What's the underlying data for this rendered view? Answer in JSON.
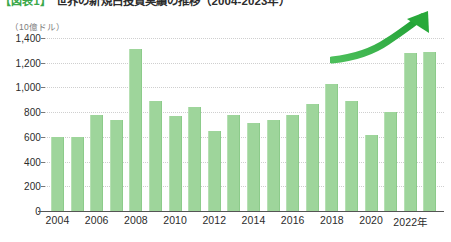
{
  "header": {
    "tag": "【図表1】",
    "title": "世界の新規白投資実績の推移（2004-2023年）"
  },
  "axis": {
    "unit_label": "（10億ドル）",
    "y_ticks": [
      "0",
      "200",
      "400",
      "600",
      "800",
      "1,000",
      "1,200",
      "1,400"
    ],
    "x_ticks": [
      "2004",
      "2006",
      "2008",
      "2010",
      "2012",
      "2014",
      "2016",
      "2018",
      "2020",
      "2022年"
    ]
  },
  "annotation": {
    "arrow_name": "growth-trend-arrow",
    "arrow_color": "#2eab3f"
  },
  "style": {
    "bar_color": "#9ed59b",
    "grid_color": "#cfcfcf",
    "accent": "#3aa84a"
  },
  "footnote": "",
  "chart_data": {
    "type": "bar",
    "xlabel": "年",
    "ylabel": "（10億ドル）",
    "ylim": [
      0,
      1400
    ],
    "ytick_step": 200,
    "grid": true,
    "legend": false,
    "categories": [
      "2004",
      "2005",
      "2006",
      "2007",
      "2008",
      "2009",
      "2010",
      "2011",
      "2012",
      "2013",
      "2014",
      "2015",
      "2016",
      "2017",
      "2018",
      "2019",
      "2020",
      "2021",
      "2022",
      "2023"
    ],
    "values": [
      600,
      600,
      775,
      740,
      1310,
      890,
      770,
      840,
      650,
      775,
      715,
      740,
      775,
      870,
      1030,
      890,
      615,
      800,
      1280,
      1290
    ],
    "series": [
      {
        "name": "新規投資額",
        "color": "#9ed59b",
        "values": [
          600,
          600,
          775,
          740,
          1310,
          890,
          770,
          840,
          650,
          775,
          715,
          740,
          775,
          870,
          1030,
          890,
          615,
          800,
          1280,
          1290
        ]
      }
    ],
    "annotations": [
      {
        "type": "arrow",
        "label": "",
        "direction": "up-right",
        "color": "#2eab3f"
      }
    ]
  }
}
